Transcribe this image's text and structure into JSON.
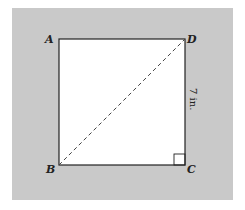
{
  "figure": {
    "shape": "square",
    "vertices": [
      {
        "name": "A",
        "position": "top-left"
      },
      {
        "name": "D",
        "position": "top-right"
      },
      {
        "name": "C",
        "position": "bottom-right"
      },
      {
        "name": "B",
        "position": "bottom-left"
      }
    ],
    "labels": {
      "A": "A",
      "B": "B",
      "C": "C",
      "D": "D"
    },
    "side_measure": "7 in.",
    "measured_side": "DC",
    "diagonal": {
      "from": "B",
      "to": "D",
      "style": "dashed"
    },
    "right_angle_marker": "C",
    "colors": {
      "background": "#c9c9c9",
      "square_fill": "#ffffff",
      "stroke": "#222222"
    }
  }
}
